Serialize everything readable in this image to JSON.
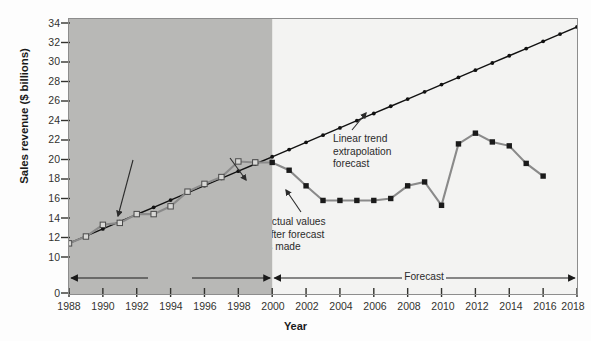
{
  "chart_data": {
    "type": "line",
    "title": "",
    "xlabel": "Year",
    "ylabel": "Sales revenue ($ billions)",
    "xlim": [
      1988,
      2018
    ],
    "ylim": [
      9.4,
      34.6
    ],
    "y_axis_break_at_zero": true,
    "grid": false,
    "legend_position": "none",
    "x_tick_labels": [
      "1988",
      "1990",
      "1992",
      "1994",
      "1996",
      "1998",
      "2000",
      "2002",
      "2004",
      "2006",
      "2008",
      "2010",
      "2012",
      "2014",
      "2016",
      "2018"
    ],
    "y_tick_labels": [
      "0",
      "10",
      "12",
      "14",
      "16",
      "18",
      "20",
      "22",
      "24",
      "26",
      "28",
      "30",
      "32",
      "34"
    ],
    "series": [
      {
        "name": "Actual values available before forecast is made",
        "marker": "open-square",
        "color": "#7d7d7d",
        "x": [
          1988,
          1989,
          1990,
          1991,
          1992,
          1993,
          1994,
          1995,
          1996,
          1997,
          1998,
          1999
        ],
        "values": [
          11.4,
          12.1,
          13.3,
          13.5,
          14.4,
          14.4,
          15.2,
          16.7,
          17.5,
          18.2,
          19.8,
          19.7
        ]
      },
      {
        "name": "Actual values after forecast is made",
        "marker": "filled-square",
        "color": "#8a8a8a",
        "x": [
          1999,
          2000,
          2001,
          2002,
          2003,
          2004,
          2005,
          2006,
          2007,
          2008,
          2009,
          2010,
          2011,
          2012,
          2013,
          2014,
          2015,
          2016
        ],
        "values": [
          19.7,
          19.7,
          18.9,
          17.3,
          15.8,
          15.8,
          15.8,
          15.8,
          16.0,
          17.3,
          17.7,
          15.3,
          21.6,
          22.7,
          21.8,
          21.4,
          19.6,
          18.3
        ]
      },
      {
        "name": "Linear trend extrapolation forecast",
        "marker": "small-dot",
        "color": "#111111",
        "x": [
          1988,
          1989,
          1990,
          1991,
          1992,
          1993,
          1994,
          1995,
          1996,
          1997,
          1998,
          1999,
          2000,
          2001,
          2002,
          2003,
          2004,
          2005,
          2006,
          2007,
          2008,
          2009,
          2010,
          2011,
          2012,
          2013,
          2014,
          2015,
          2016,
          2017,
          2018
        ],
        "values": [
          11.4,
          12.14,
          12.88,
          13.62,
          14.36,
          15.1,
          15.84,
          16.58,
          17.32,
          18.06,
          18.8,
          19.54,
          20.28,
          21.02,
          21.76,
          22.5,
          23.24,
          23.98,
          24.72,
          25.46,
          26.2,
          26.94,
          27.68,
          28.42,
          29.16,
          29.9,
          30.64,
          31.38,
          32.12,
          32.86,
          33.6
        ]
      }
    ],
    "annotations": [
      {
        "id": "anno-actual-before",
        "text": "Actual values available\nbefore forecast is made"
      },
      {
        "id": "anno-actual-after",
        "text": "Actual values\nafter forecast\nis made"
      },
      {
        "id": "anno-trend",
        "text": "Linear trend\nextrapolation\nforecast"
      }
    ],
    "period_brackets": [
      {
        "id": "bracket-actual",
        "label": "Actual",
        "from": 1988,
        "to": 2000
      },
      {
        "id": "bracket-forecast",
        "label": "Forecast",
        "from": 2000,
        "to": 2018
      }
    ],
    "shaded_region": {
      "label": "actual-period-shading",
      "from": 1988,
      "to": 2000,
      "color": "#b8b8b6"
    }
  }
}
